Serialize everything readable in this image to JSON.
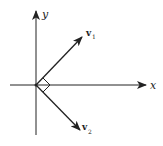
{
  "diagram": {
    "title": "",
    "axes": {
      "x_label": "x",
      "y_label": "y"
    },
    "vectors": [
      {
        "name": "v",
        "subscript": "1",
        "direction": "up-right (45°)"
      },
      {
        "name": "v",
        "subscript": "2",
        "direction": "down-right (-45°)"
      }
    ],
    "annotations": {
      "right_angle_marker": "right angle between v1 and v2 at origin"
    },
    "colors": {
      "stroke": "#222222",
      "background": "#ffffff"
    }
  }
}
